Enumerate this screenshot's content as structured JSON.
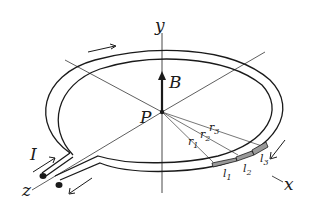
{
  "diagram": {
    "type": "current-loop-magnetic-field",
    "labels": {
      "y_axis": "y",
      "x_axis": "x",
      "z_axis": "z",
      "field": "B",
      "point": "P",
      "current": "I",
      "r1": "r",
      "r1_sub": "1",
      "r2": "r",
      "r2_sub": "2",
      "r3": "r",
      "r3_sub": "3",
      "l1": "l",
      "l1_sub": "1",
      "l2": "l",
      "l2_sub": "2",
      "l3": "l",
      "l3_sub": "3"
    },
    "colors": {
      "ink": "#1a1a1a",
      "segment_fill": "#9a9a9a",
      "background": "#ffffff"
    }
  }
}
